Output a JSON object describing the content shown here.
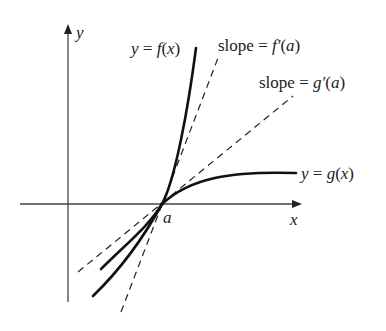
{
  "figure": {
    "axes": {
      "x_label": "x",
      "y_label": "y"
    },
    "point": {
      "label": "a"
    },
    "curves": [
      {
        "id": "f",
        "label_prefix": "y = ",
        "label_func": "f",
        "label_arg": "(x)"
      },
      {
        "id": "g",
        "label_prefix": "y = ",
        "label_func": "g",
        "label_arg": "(x)"
      }
    ],
    "tangents": [
      {
        "id": "f-tangent",
        "label_word": "slope = ",
        "label_func": "f′",
        "label_arg": "(a)"
      },
      {
        "id": "g-tangent",
        "label_word": "slope = ",
        "label_func": "g′",
        "label_arg": "(a)"
      }
    ],
    "colors": {
      "ink": "#222222",
      "background": "#ffffff"
    }
  }
}
